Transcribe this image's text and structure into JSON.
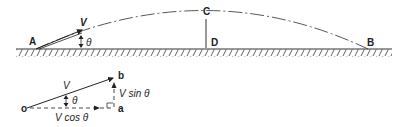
{
  "diagram": {
    "type": "projectile-trajectory",
    "trajectory": {
      "points": {
        "A": "A",
        "B": "B",
        "C": "C",
        "D": "D"
      },
      "velocity_label": "V",
      "angle_label": "θ"
    },
    "vector_resolution": {
      "origin": "o",
      "tip": "b",
      "corner": "a",
      "resultant_label": "V",
      "angle_label": "θ",
      "horizontal_component": "V cos θ",
      "vertical_component": "V sin θ"
    }
  }
}
